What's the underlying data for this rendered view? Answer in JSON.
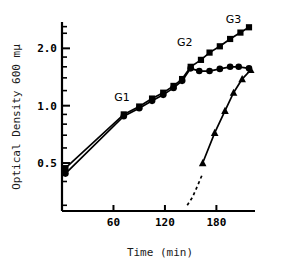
{
  "chart_data": {
    "type": "line",
    "title": "",
    "xlabel": "Time  (min)",
    "ylabel": "Optical Density 600 mμ",
    "yscale": "log",
    "xlim": [
      0,
      225
    ],
    "ylim": [
      0.28,
      2.75
    ],
    "xticks": [
      60,
      120,
      180
    ],
    "xticklabels": [
      "60",
      "120",
      "180"
    ],
    "yticks": [
      0.5,
      1.0,
      2.0
    ],
    "yticklabels": [
      "0.5",
      "1.0",
      "2.0"
    ],
    "yminorticks": [
      0.3,
      0.4,
      0.6,
      0.7,
      0.8,
      0.9,
      1.2,
      1.4,
      1.6,
      1.8,
      2.4,
      2.6
    ],
    "grid": false,
    "legend": "none",
    "annotations": [
      {
        "text": "G1",
        "x": 70,
        "y": 1.06,
        "name": "phase-label-g1"
      },
      {
        "text": "G2",
        "x": 143,
        "y": 2.05,
        "name": "phase-label-g2"
      },
      {
        "text": "G3",
        "x": 200,
        "y": 2.72,
        "name": "phase-label-g3"
      }
    ],
    "series": [
      {
        "name": "growth-upper",
        "marker": "square",
        "linestyle": "solid",
        "points": [
          {
            "x": 4,
            "y": 0.47
          },
          {
            "x": 72,
            "y": 0.9
          },
          {
            "x": 90,
            "y": 0.99
          },
          {
            "x": 105,
            "y": 1.09
          },
          {
            "x": 118,
            "y": 1.17
          },
          {
            "x": 130,
            "y": 1.27
          },
          {
            "x": 140,
            "y": 1.38
          },
          {
            "x": 150,
            "y": 1.6
          },
          {
            "x": 162,
            "y": 1.74
          },
          {
            "x": 172,
            "y": 1.9
          },
          {
            "x": 184,
            "y": 2.05
          },
          {
            "x": 196,
            "y": 2.24
          },
          {
            "x": 208,
            "y": 2.42
          },
          {
            "x": 218,
            "y": 2.58
          }
        ]
      },
      {
        "name": "growth-plateau",
        "marker": "circle",
        "linestyle": "solid",
        "points": [
          {
            "x": 4,
            "y": 0.44
          },
          {
            "x": 72,
            "y": 0.88
          },
          {
            "x": 90,
            "y": 0.97
          },
          {
            "x": 105,
            "y": 1.06
          },
          {
            "x": 118,
            "y": 1.14
          },
          {
            "x": 130,
            "y": 1.24
          },
          {
            "x": 140,
            "y": 1.35
          },
          {
            "x": 150,
            "y": 1.57
          },
          {
            "x": 160,
            "y": 1.52
          },
          {
            "x": 172,
            "y": 1.52
          },
          {
            "x": 184,
            "y": 1.56
          },
          {
            "x": 196,
            "y": 1.6
          },
          {
            "x": 206,
            "y": 1.6
          },
          {
            "x": 218,
            "y": 1.57
          }
        ]
      },
      {
        "name": "delayed-growth",
        "marker": "triangle",
        "linestyle": "solid-with-dashed-extrapolation",
        "dashed_points": [
          {
            "x": 146,
            "y": 0.3
          },
          {
            "x": 152,
            "y": 0.33
          },
          {
            "x": 158,
            "y": 0.38
          },
          {
            "x": 164,
            "y": 0.44
          }
        ],
        "points": [
          {
            "x": 164,
            "y": 0.5
          },
          {
            "x": 178,
            "y": 0.72
          },
          {
            "x": 190,
            "y": 0.94
          },
          {
            "x": 200,
            "y": 1.17
          },
          {
            "x": 210,
            "y": 1.38
          },
          {
            "x": 220,
            "y": 1.54
          }
        ]
      }
    ]
  }
}
